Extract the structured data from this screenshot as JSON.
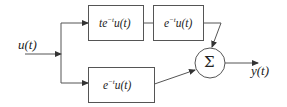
{
  "diagram": {
    "input": {
      "label": "u(t)"
    },
    "output": {
      "label": "y(t)"
    },
    "blocks": [
      {
        "id": "block-top-1",
        "label_base": "te",
        "label_sup": "−t",
        "label_tail": "u(t)"
      },
      {
        "id": "block-top-2",
        "label_base": "e",
        "label_sup": "−t",
        "label_tail": "u(t)"
      },
      {
        "id": "block-bottom",
        "label_base": "e",
        "label_sup": "−t",
        "label_tail": "u(t)"
      }
    ],
    "summer": {
      "symbol": "Σ"
    },
    "colors": {
      "line": "#555555",
      "text": "#222222",
      "background": "#ffffff"
    }
  }
}
